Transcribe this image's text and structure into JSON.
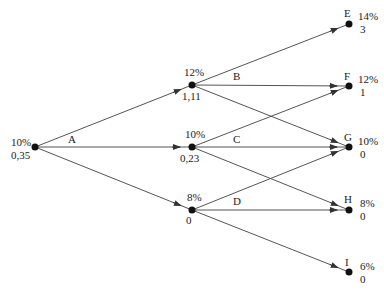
{
  "diagram": {
    "type": "binomial-tree",
    "nodes": [
      {
        "id": "root",
        "rate": "10%",
        "value": "0,35",
        "name": ""
      },
      {
        "id": "u",
        "rate": "12%",
        "value": "1,11",
        "name": ""
      },
      {
        "id": "m",
        "rate": "10%",
        "value": "0,23",
        "name": ""
      },
      {
        "id": "d",
        "rate": "8%",
        "value": "0",
        "name": ""
      },
      {
        "id": "E",
        "rate": "14%",
        "value": "3",
        "name": "E"
      },
      {
        "id": "F",
        "rate": "12%",
        "value": "1",
        "name": "F"
      },
      {
        "id": "G",
        "rate": "10%",
        "value": "0",
        "name": "G"
      },
      {
        "id": "H",
        "rate": "8%",
        "value": "0",
        "name": "H"
      },
      {
        "id": "I",
        "rate": "6%",
        "value": "0",
        "name": "I"
      }
    ],
    "edges": [
      {
        "from": "root",
        "to": "u"
      },
      {
        "from": "root",
        "to": "m"
      },
      {
        "from": "root",
        "to": "d"
      },
      {
        "from": "u",
        "to": "E"
      },
      {
        "from": "u",
        "to": "F"
      },
      {
        "from": "u",
        "to": "G"
      },
      {
        "from": "m",
        "to": "F"
      },
      {
        "from": "m",
        "to": "G"
      },
      {
        "from": "m",
        "to": "H"
      },
      {
        "from": "d",
        "to": "G"
      },
      {
        "from": "d",
        "to": "H"
      },
      {
        "from": "d",
        "to": "I"
      }
    ],
    "branch_labels": {
      "A": "A",
      "B": "B",
      "C": "C",
      "D": "D"
    }
  }
}
